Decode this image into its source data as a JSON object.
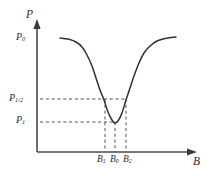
{
  "figure": {
    "background_color": "#ffffff",
    "line_color": "#2f2f2f",
    "axis_color": "#4a4a4a",
    "dash_color": "#555555",
    "axes": {
      "y_axis_name": "P",
      "x_axis_name": "B"
    },
    "y_ticks": [
      {
        "id": "P0",
        "base": "P",
        "sub": "0",
        "value_y_px": 38
      },
      {
        "id": "Phalf",
        "base": "P",
        "sub": "1/2",
        "value_y_px": 99
      },
      {
        "id": "P1",
        "base": "P",
        "sub": "1",
        "value_y_px": 122
      }
    ],
    "x_ticks": [
      {
        "id": "B1",
        "base": "B",
        "sub": "1",
        "value_x_px": 105
      },
      {
        "id": "B0",
        "base": "B",
        "sub": "0",
        "value_x_px": 115
      },
      {
        "id": "B2",
        "base": "B",
        "sub": "2",
        "value_x_px": 126
      }
    ]
  },
  "chart_data": {
    "type": "line",
    "title": "",
    "subtitle": "",
    "xlabel": "B",
    "ylabel": "P",
    "grid": false,
    "legend": null,
    "xlim": [
      37,
      207
    ],
    "ylim": [
      152,
      20
    ],
    "axis_lines": {
      "y_axis": {
        "x": 37,
        "y_top": 22,
        "y_bottom": 152
      },
      "x_axis": {
        "y": 152,
        "x_left": 37,
        "x_right": 196
      }
    },
    "series": [
      {
        "name": "P(B)",
        "style": "solid",
        "points_px": [
          [
            60,
            38
          ],
          [
            68,
            39
          ],
          [
            76,
            42
          ],
          [
            82,
            47
          ],
          [
            87,
            55
          ],
          [
            92,
            66
          ],
          [
            96,
            78
          ],
          [
            100,
            90
          ],
          [
            104,
            100
          ],
          [
            108,
            112
          ],
          [
            112,
            120
          ],
          [
            115,
            123
          ],
          [
            118,
            121
          ],
          [
            122,
            113
          ],
          [
            126,
            100
          ],
          [
            130,
            88
          ],
          [
            134,
            76
          ],
          [
            139,
            63
          ],
          [
            144,
            53
          ],
          [
            150,
            46
          ],
          [
            157,
            41
          ],
          [
            165,
            38.5
          ],
          [
            176,
            37
          ]
        ]
      }
    ],
    "guide_lines": [
      {
        "name": "P-half-horizontal",
        "orientation": "horizontal",
        "y_px": 99,
        "x_from": 40,
        "x_to": 126,
        "style": "dashed"
      },
      {
        "name": "P-one-horizontal",
        "orientation": "horizontal",
        "y_px": 122,
        "x_from": 40,
        "x_to": 115,
        "style": "dashed"
      },
      {
        "name": "B1-vertical",
        "orientation": "vertical",
        "x_px": 105,
        "y_from": 99,
        "y_to": 152,
        "style": "dashed"
      },
      {
        "name": "B0-vertical",
        "orientation": "vertical",
        "x_px": 115,
        "y_from": 122,
        "y_to": 152,
        "style": "dashed"
      },
      {
        "name": "B2-vertical",
        "orientation": "vertical",
        "x_px": 126,
        "y_from": 99,
        "y_to": 152,
        "style": "dashed"
      }
    ]
  }
}
